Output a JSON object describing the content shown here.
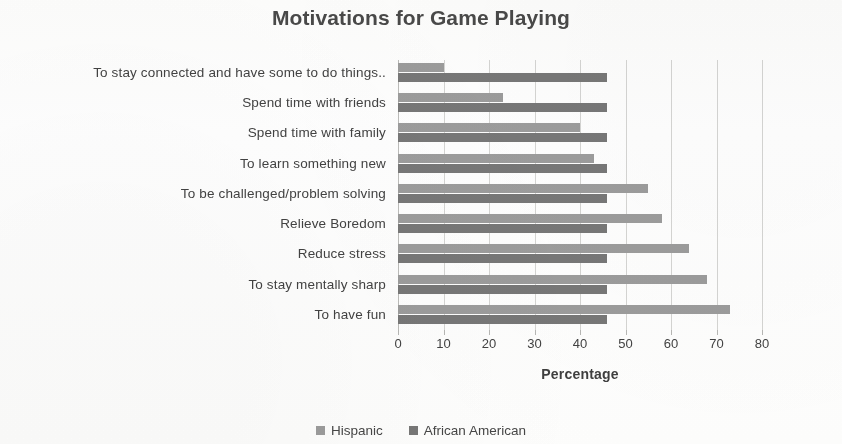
{
  "chart_data": {
    "type": "bar",
    "orientation": "horizontal",
    "title": "Motivations for Game Playing",
    "xlabel": "Percentage",
    "ylabel": "",
    "xlim": [
      0,
      80
    ],
    "xticks": [
      0,
      10,
      20,
      30,
      40,
      50,
      60,
      70,
      80
    ],
    "grid": true,
    "legend_position": "bottom",
    "categories": [
      "To stay connected and have some to do things..",
      "Spend time with friends",
      "Spend time with family",
      "To learn something new",
      "To be challenged/problem solving",
      "Relieve Boredom",
      "Reduce stress",
      "To stay mentally sharp",
      "To have fun"
    ],
    "series": [
      {
        "name": "Hispanic",
        "color": "#9d9d9d",
        "values": [
          10,
          23,
          40,
          43,
          55,
          58,
          64,
          68,
          73
        ]
      },
      {
        "name": "African American",
        "color": "#787878",
        "values": [
          46,
          46,
          46,
          46,
          46,
          46,
          46,
          46,
          46
        ]
      }
    ]
  },
  "legend": {
    "items": [
      {
        "label": "Hispanic",
        "color": "#9d9d9d"
      },
      {
        "label": "African American",
        "color": "#787878"
      }
    ]
  }
}
